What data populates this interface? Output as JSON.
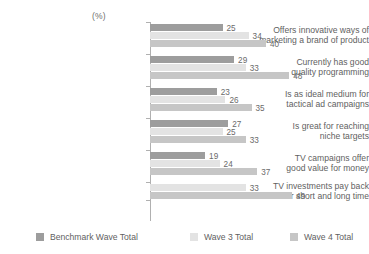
{
  "chart_data": {
    "type": "bar",
    "orientation": "horizontal",
    "title": "",
    "subtitle": "",
    "unit_label": "(%)",
    "xlabel": "",
    "ylabel": "",
    "xlim": [
      0,
      50
    ],
    "grid": false,
    "legend_position": "bottom",
    "categories": [
      "Offers innovative ways of\nmarketing a brand of product",
      "Currently has good\nquality programming",
      "Is as ideal medium for\ntactical ad campaigns",
      "Is great for reaching\nniche targets",
      "TV campaigns offer\ngood value for money",
      "TV investments pay back\nover short and long time"
    ],
    "series": [
      {
        "name": "Benchmark Wave Total",
        "color": "#9d9d9d",
        "values": [
          25,
          29,
          23,
          27,
          19,
          null
        ]
      },
      {
        "name": "Wave 3 Total",
        "color": "#e3e3e3",
        "values": [
          34,
          33,
          26,
          25,
          24,
          33
        ]
      },
      {
        "name": "Wave 4 Total",
        "color": "#c6c6c6",
        "values": [
          40,
          48,
          35,
          33,
          37,
          49
        ]
      }
    ]
  },
  "legend": {
    "items": [
      {
        "label": "Benchmark Wave Total",
        "color": "#9d9d9d"
      },
      {
        "label": "Wave 3 Total",
        "color": "#e3e3e3"
      },
      {
        "label": "Wave 4 Total",
        "color": "#c6c6c6"
      }
    ]
  }
}
